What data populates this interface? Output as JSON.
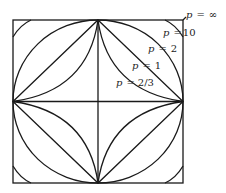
{
  "diagram": {
    "labels": [
      {
        "id": "pinf",
        "p": "p",
        "eq": "=",
        "val": "∞",
        "x": 186,
        "y": 18
      },
      {
        "id": "p10",
        "p": "p",
        "eq": "=",
        "val": "10",
        "x": 163,
        "y": 36
      },
      {
        "id": "p2",
        "p": "p",
        "eq": "=",
        "val": "2",
        "x": 148,
        "y": 52
      },
      {
        "id": "p1",
        "p": "p",
        "eq": "=",
        "val": "1",
        "x": 132,
        "y": 69
      },
      {
        "id": "p23",
        "p": "p",
        "eq": "=",
        "val": "2/3",
        "x": 116,
        "y": 86
      }
    ],
    "curves": [
      "p = ∞",
      "p = 10",
      "p = 2",
      "p = 1",
      "p = 2/3"
    ],
    "color": "#1a1a1a"
  }
}
